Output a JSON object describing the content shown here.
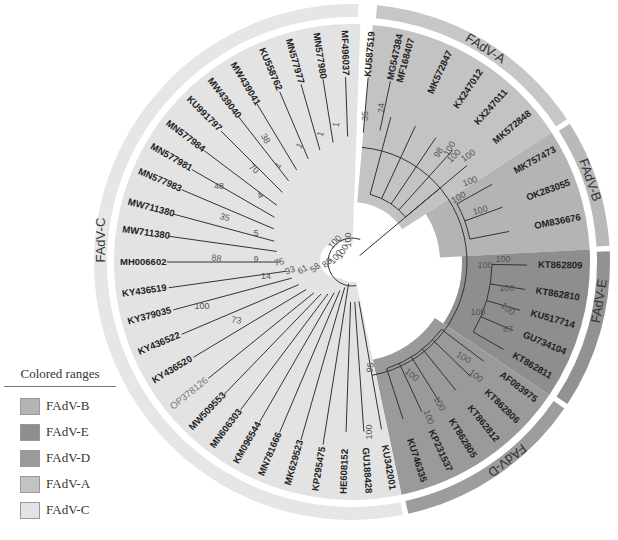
{
  "figure": {
    "type": "circular-phylogenetic-tree",
    "center": [
      352,
      262
    ]
  },
  "legend": {
    "title": "Colored ranges",
    "items": [
      {
        "label": "FAdV-B",
        "color": "#b4b4b4"
      },
      {
        "label": "FAdV-E",
        "color": "#8e8e8e"
      },
      {
        "label": "FAdV-D",
        "color": "#9a9a9a"
      },
      {
        "label": "FAdV-A",
        "color": "#c3c3c3"
      },
      {
        "label": "FAdV-C",
        "color": "#e3e3e3"
      }
    ]
  },
  "ranges": [
    {
      "name": "FAdV-A",
      "start": -85,
      "end": -33,
      "fill": "#c3c3c3",
      "ring": "#c7c7c7",
      "label_angle": -58
    },
    {
      "name": "FAdV-B",
      "start": -33,
      "end": -3,
      "fill": "#b4b4b4",
      "ring": "#b9b9b9",
      "label_angle": -19
    },
    {
      "name": "FAdV-E",
      "start": -3,
      "end": 34,
      "fill": "#8e8e8e",
      "ring": "#929292",
      "label_angle": 9
    },
    {
      "name": "FAdV-D",
      "start": 34,
      "end": 78,
      "fill": "#9a9a9a",
      "ring": "#9d9d9d",
      "label_angle": 52
    },
    {
      "name": "FAdV-C",
      "start": 78,
      "end": 272,
      "fill": "#e3e3e3",
      "ring": "#e6e6e6",
      "label_angle": 185
    }
  ],
  "leaves": [
    {
      "name": "MF168407",
      "angle": -75
    },
    {
      "name": "MK572847",
      "angle": -65
    },
    {
      "name": "KX247012",
      "angle": -56
    },
    {
      "name": "KX247011",
      "angle": -48
    },
    {
      "name": "MK572848",
      "angle": -40
    },
    {
      "name": "MK757473",
      "angle": -29
    },
    {
      "name": "OK283055",
      "angle": -20
    },
    {
      "name": "OM836676",
      "angle": -11
    },
    {
      "name": "KT862809",
      "angle": 1
    },
    {
      "name": "KT862810",
      "angle": 9
    },
    {
      "name": "KU517714",
      "angle": 16
    },
    {
      "name": "GU734104",
      "angle": 23
    },
    {
      "name": "KT862811",
      "angle": 30
    },
    {
      "name": "AF083975",
      "angle": 37
    },
    {
      "name": "KT862806",
      "angle": 44
    },
    {
      "name": "KT862812",
      "angle": 51
    },
    {
      "name": "KT862805",
      "angle": 58
    },
    {
      "name": "KP231537",
      "angle": 65
    },
    {
      "name": "KU746335",
      "angle": 72
    },
    {
      "name": "KU342001",
      "angle": 80
    },
    {
      "name": "GU188428",
      "angle": 86
    },
    {
      "name": "HE608152",
      "angle": 92
    },
    {
      "name": "KP295475",
      "angle": 99
    },
    {
      "name": "MK629523",
      "angle": 106
    },
    {
      "name": "MN781666",
      "angle": 113
    },
    {
      "name": "KM096544",
      "angle": 120
    },
    {
      "name": "MN606303",
      "angle": 127
    },
    {
      "name": "MW509553",
      "angle": 134
    },
    {
      "name": "OP378126",
      "angle": 141,
      "style": "gray"
    },
    {
      "name": "KY436520",
      "angle": 149
    },
    {
      "name": "KY436522",
      "angle": 157
    },
    {
      "name": "KY379035",
      "angle": 165
    },
    {
      "name": "KY436519",
      "angle": 172
    },
    {
      "name": "MH006602",
      "angle": 180
    },
    {
      "name": "MW711380",
      "angle": 188
    },
    {
      "name": "MW711380",
      "angle": 195
    },
    {
      "name": "MN577983",
      "angle": 203
    },
    {
      "name": "MN577981",
      "angle": 210
    },
    {
      "name": "MN577984",
      "angle": 217
    },
    {
      "name": "KU991797",
      "angle": 225
    },
    {
      "name": "MW439040",
      "angle": 232
    },
    {
      "name": "MW439041",
      "angle": 239
    },
    {
      "name": "KU558762",
      "angle": 247
    },
    {
      "name": "MN577977",
      "angle": 254
    },
    {
      "name": "MN577980",
      "angle": 261
    },
    {
      "name": "MF496037",
      "angle": 268
    },
    {
      "name": "KU587519",
      "angle": 275
    },
    {
      "name": "MG547384",
      "angle": 282
    }
  ],
  "bootstrap_labels": [
    {
      "value": "100",
      "x": 337,
      "y": 244,
      "rot": -48
    },
    {
      "value": "100",
      "x": 460,
      "y": 200,
      "rot": -30
    },
    {
      "value": "100",
      "x": 485,
      "y": 268,
      "rot": 0
    },
    {
      "value": "100",
      "x": 478,
      "y": 315,
      "rot": 0
    },
    {
      "value": "100",
      "x": 462,
      "y": 360,
      "rot": 30
    },
    {
      "value": "100",
      "x": 503,
      "y": 262,
      "rot": 0
    },
    {
      "value": "100",
      "x": 507,
      "y": 291,
      "rot": 0
    },
    {
      "value": "100",
      "x": 506,
      "y": 311,
      "rot": 40
    },
    {
      "value": "87",
      "x": 508,
      "y": 332,
      "rot": 0
    },
    {
      "value": "100",
      "x": 410,
      "y": 377,
      "rot": 40
    },
    {
      "value": "100",
      "x": 474,
      "y": 378,
      "rot": 40
    },
    {
      "value": "100",
      "x": 437,
      "y": 405,
      "rot": 60
    },
    {
      "value": "100",
      "x": 426,
      "y": 418,
      "rot": 70
    },
    {
      "value": "100",
      "x": 452,
      "y": 150,
      "rot": -60
    },
    {
      "value": "98",
      "x": 441,
      "y": 154,
      "rot": -60
    },
    {
      "value": "100",
      "x": 456,
      "y": 158,
      "rot": -45
    },
    {
      "value": "100",
      "x": 470,
      "y": 158,
      "rot": -35
    },
    {
      "value": "100",
      "x": 471,
      "y": 184,
      "rot": -20
    },
    {
      "value": "100",
      "x": 481,
      "y": 213,
      "rot": -15
    },
    {
      "value": "95",
      "x": 373,
      "y": 368,
      "rot": -80
    },
    {
      "value": "100",
      "x": 372,
      "y": 432,
      "rot": -90
    },
    {
      "value": "100",
      "x": 351,
      "y": 240,
      "rot": -90
    },
    {
      "value": "100",
      "x": 345,
      "y": 253,
      "rot": -60
    },
    {
      "value": "100",
      "x": 338,
      "y": 259,
      "rot": -50
    },
    {
      "value": "88",
      "x": 329,
      "y": 265,
      "rot": -40
    },
    {
      "value": "58",
      "x": 317,
      "y": 270,
      "rot": -40
    },
    {
      "value": "61",
      "x": 304,
      "y": 272,
      "rot": -30
    },
    {
      "value": "93",
      "x": 291,
      "y": 273,
      "rot": -20
    },
    {
      "value": "75",
      "x": 280,
      "y": 265,
      "rot": -15
    },
    {
      "value": "14",
      "x": 266,
      "y": 279,
      "rot": 0
    },
    {
      "value": "73",
      "x": 236,
      "y": 323,
      "rot": 10
    },
    {
      "value": "100",
      "x": 202,
      "y": 309,
      "rot": 0
    },
    {
      "value": "9",
      "x": 256,
      "y": 262,
      "rot": 0
    },
    {
      "value": "88",
      "x": 216,
      "y": 261,
      "rot": 10
    },
    {
      "value": "5",
      "x": 256,
      "y": 236,
      "rot": 0
    },
    {
      "value": "35",
      "x": 224,
      "y": 220,
      "rot": 15
    },
    {
      "value": "48",
      "x": 219,
      "y": 189,
      "rot": 0
    },
    {
      "value": "4",
      "x": 262,
      "y": 198,
      "rot": -40
    },
    {
      "value": "70",
      "x": 252,
      "y": 171,
      "rot": 40
    },
    {
      "value": "38",
      "x": 263,
      "y": 140,
      "rot": 60
    },
    {
      "value": "1",
      "x": 280,
      "y": 167,
      "rot": -50
    },
    {
      "value": "1",
      "x": 302,
      "y": 147,
      "rot": -60
    },
    {
      "value": "1",
      "x": 323,
      "y": 135,
      "rot": -70
    },
    {
      "value": "1",
      "x": 339,
      "y": 125,
      "rot": -80
    },
    {
      "value": "35",
      "x": 368,
      "y": 116,
      "rot": -90
    },
    {
      "value": "24",
      "x": 384,
      "y": 108,
      "rot": -90
    }
  ]
}
